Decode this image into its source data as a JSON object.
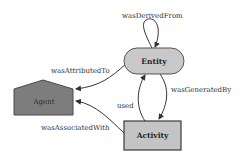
{
  "diagram": {
    "type": "provenance-graph",
    "nodes": {
      "entity": {
        "label": "Entity",
        "shape": "rounded-pill",
        "fill": "#c9c9c9",
        "stroke": "#555555"
      },
      "agent": {
        "label": "Agent",
        "shape": "house-pentagon",
        "fill": "#7d7d7d",
        "stroke": "#4a4a4a"
      },
      "activity": {
        "label": "Activity",
        "shape": "rectangle",
        "fill": "#c4c4c4",
        "stroke": "#3a3a3a"
      }
    },
    "edges": {
      "wasDerivedFrom": {
        "label": "wasDerivedFrom",
        "from": "Entity",
        "to": "Entity"
      },
      "wasAttributedTo": {
        "label": "wasAttributedTo",
        "from": "Entity",
        "to": "Agent"
      },
      "wasGeneratedBy": {
        "label": "wasGeneratedBy",
        "from": "Entity",
        "to": "Activity"
      },
      "used": {
        "label": "used",
        "from": "Activity",
        "to": "Entity"
      },
      "wasAssociatedWith": {
        "label": "wasAssociatedWith",
        "from": "Activity",
        "to": "Agent"
      }
    },
    "colors": {
      "edge": "#333333",
      "background": "#ffffff"
    }
  }
}
